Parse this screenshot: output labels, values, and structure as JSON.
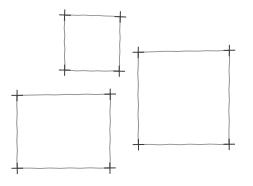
{
  "canvas": {
    "width": 253,
    "height": 186,
    "background_color": "#ffffff",
    "title": "Hand-drawn squares sketch"
  },
  "style": {
    "stroke_color": "#8c8c90",
    "stroke_color_dark": "#4a4a4e",
    "corner_mark_color": "#3a3a3e",
    "edge_stroke_width": 0.9,
    "corner_stroke_width": 1.0,
    "corner_mark_arm_length": 5
  },
  "chart_data": {
    "type": "scatter",
    "xlabel": "",
    "ylabel": "",
    "xlim": [
      0,
      253
    ],
    "ylim": [
      0,
      186
    ],
    "grid": false,
    "legend": "none",
    "annotations": [
      "Three hand-drawn rectangles with cross marks at each corner"
    ],
    "shapes": [
      {
        "name": "square-top",
        "label": "Top small square",
        "x": 65,
        "y": 15,
        "width": 55,
        "height": 56,
        "corners": [
          [
            65,
            15
          ],
          [
            120,
            17
          ],
          [
            119,
            71
          ],
          [
            65,
            70
          ]
        ]
      },
      {
        "name": "rect-bottom-left",
        "label": "Bottom-left rectangle",
        "x": 17,
        "y": 95,
        "width": 93,
        "height": 73,
        "corners": [
          [
            17,
            95
          ],
          [
            110,
            94
          ],
          [
            110,
            168
          ],
          [
            17,
            168
          ]
        ]
      },
      {
        "name": "square-right",
        "label": "Right large square",
        "x": 138,
        "y": 52,
        "width": 91,
        "height": 92,
        "corners": [
          [
            138,
            52
          ],
          [
            229,
            50
          ],
          [
            229,
            144
          ],
          [
            138,
            144
          ]
        ]
      }
    ]
  },
  "shape_names": {
    "square_top": "square-top",
    "rect_bottom_left": "rect-bottom-left",
    "square_right": "square-right"
  }
}
